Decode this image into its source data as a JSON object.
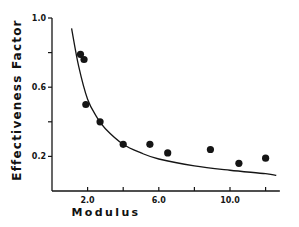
{
  "chart_data": {
    "type": "scatter",
    "title": "",
    "xlabel": "Modulus",
    "ylabel": "Effectiveness Factor",
    "xlim": [
      0.0,
      12.8
    ],
    "ylim": [
      0.0,
      1.0
    ],
    "x_ticks": [
      2.0,
      4.0,
      6.0,
      8.0,
      10.0,
      12.0
    ],
    "x_tick_labels": [
      "2.0",
      "",
      "6.0",
      "",
      "10.0",
      ""
    ],
    "y_ticks": [
      0.2,
      0.4,
      0.6,
      0.8,
      1.0
    ],
    "y_tick_labels": [
      "0.2",
      "",
      "0.6",
      "",
      "1.0"
    ],
    "grid": false,
    "legend": null,
    "series": [
      {
        "name": "Experimental",
        "kind": "points",
        "x": [
          1.6,
          1.8,
          1.9,
          2.7,
          4.0,
          5.5,
          6.5,
          8.9,
          10.5,
          12.0
        ],
        "y": [
          0.79,
          0.76,
          0.5,
          0.4,
          0.27,
          0.27,
          0.22,
          0.24,
          0.16,
          0.19
        ]
      },
      {
        "name": "Theoretical",
        "kind": "curve",
        "x": [
          1.1,
          1.5,
          2.0,
          2.5,
          3.0,
          4.0,
          5.0,
          6.0,
          8.0,
          10.0,
          12.0,
          12.6
        ],
        "y": [
          0.94,
          0.72,
          0.53,
          0.43,
          0.36,
          0.27,
          0.22,
          0.185,
          0.145,
          0.12,
          0.1,
          0.09
        ]
      }
    ]
  },
  "labels": {
    "ylabel": "Effectiveness   Factor",
    "xlabel": "Modulus"
  }
}
